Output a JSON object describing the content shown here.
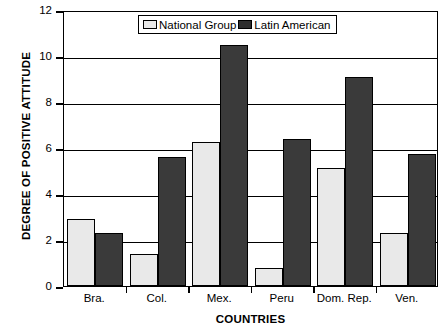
{
  "chart_data": {
    "type": "bar",
    "title": "",
    "subtitle": "",
    "xlabel": "COUNTRIES",
    "ylabel": "DEGREE OF POSITIVE ATTITUDE",
    "categories": [
      "Bra.",
      "Col.",
      "Mex.",
      "Peru",
      "Dom. Rep.",
      "Ven."
    ],
    "series": [
      {
        "name": "National Group",
        "color": "#e9e9e9",
        "values": [
          2.9,
          1.4,
          6.25,
          0.8,
          5.15,
          2.3
        ]
      },
      {
        "name": "Latin American",
        "color": "#3a3a3a",
        "values": [
          2.3,
          5.6,
          10.5,
          6.4,
          9.1,
          5.75
        ]
      }
    ],
    "ylim": [
      0,
      12
    ],
    "yticks": [
      0,
      2,
      4,
      6,
      8,
      10,
      12
    ],
    "ytick_labels": [
      "0",
      "2",
      "4",
      "6",
      "8",
      "10",
      "12"
    ],
    "grid": true,
    "grid_axis": "y",
    "legend_position": "top-center",
    "bar_edge_color": "#000000",
    "frame_color": "#000000",
    "background": "#ffffff"
  },
  "legend": {
    "entries": [
      {
        "label": "National Group",
        "swatch": "light"
      },
      {
        "label": "Latin American",
        "swatch": "dark"
      }
    ]
  }
}
